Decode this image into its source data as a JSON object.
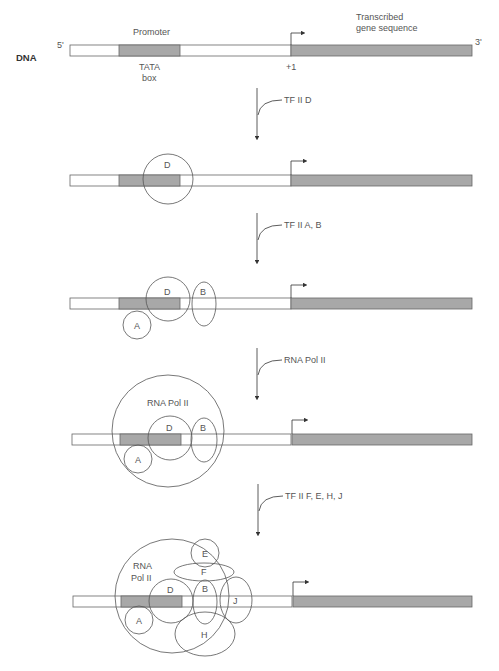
{
  "figure": {
    "dna_label": "DNA",
    "five_prime": "5'",
    "three_prime": "3'",
    "promoter_label": "Promoter",
    "tata_label_line1": "TATA",
    "tata_label_line2": "box",
    "plus_one_label": "+1",
    "transcribed_line1": "Transcribed",
    "transcribed_line2": "gene sequence",
    "colors": {
      "strand_fill": "#ffffff",
      "tata_fill": "#a8a8a8",
      "gene_fill": "#a8a8a8",
      "outline": "#555555",
      "text": "#555555"
    }
  },
  "steps": [
    {
      "arrow_label": "TF II D"
    },
    {
      "arrow_label": "TF II A, B"
    },
    {
      "arrow_label": "RNA Pol II"
    },
    {
      "arrow_label": "TF II F, E, H, J"
    }
  ],
  "complexes": [
    {
      "proteins": [
        "D"
      ]
    },
    {
      "proteins": [
        "D",
        "B",
        "A"
      ]
    },
    {
      "proteins": [
        "RNA Pol II",
        "D",
        "B",
        "A"
      ]
    },
    {
      "proteins": [
        "RNA Pol II",
        "E",
        "F",
        "D",
        "B",
        "J",
        "A",
        "H"
      ],
      "pol_line1": "RNA",
      "pol_line2": "Pol II"
    }
  ]
}
